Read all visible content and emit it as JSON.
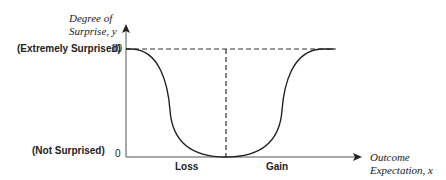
{
  "y_axis": {
    "title_line1": "Degree of",
    "title_line2": "Surprise, y",
    "tick_top": "10",
    "tick_bottom": "0",
    "label_top": "(Extremely Surprised)",
    "label_bottom": "(Not Surprised)"
  },
  "x_axis": {
    "title_line1": "Outcome",
    "title_line2": "Expectation, x",
    "label_left": "Loss",
    "label_right": "Gain"
  },
  "colors": {
    "line": "#222222"
  }
}
